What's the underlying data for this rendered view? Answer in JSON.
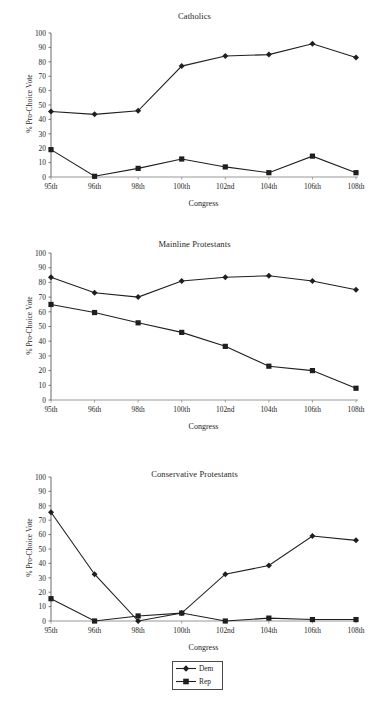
{
  "figure": {
    "legend": {
      "position": "bottom-center",
      "entries": [
        {
          "label": "Dem",
          "marker": "diamond",
          "color": "#1a1a1a"
        },
        {
          "label": "Rep",
          "marker": "square",
          "color": "#1a1a1a"
        }
      ]
    }
  },
  "chart_data": [
    {
      "type": "line",
      "title": "Catholics",
      "xlabel": "Congress",
      "ylabel": "% Pro-Choice Vote",
      "categories": [
        "95th",
        "96th",
        "98th",
        "100th",
        "102nd",
        "104th",
        "106th",
        "108th"
      ],
      "ylim": [
        0,
        100
      ],
      "yticks": [
        0,
        10,
        20,
        30,
        40,
        50,
        60,
        70,
        80,
        90,
        100
      ],
      "grid": false,
      "series": [
        {
          "name": "Dem",
          "marker": "diamond",
          "values": [
            45.5,
            43.5,
            46,
            77,
            84,
            85,
            92.5,
            83
          ]
        },
        {
          "name": "Rep",
          "marker": "square",
          "values": [
            19,
            0.5,
            6,
            12.5,
            7,
            3,
            14.5,
            3
          ]
        }
      ]
    },
    {
      "type": "line",
      "title": "Mainline Protestants",
      "xlabel": "Congress",
      "ylabel": "% Pro-Choice Vote",
      "categories": [
        "95th",
        "96th",
        "98th",
        "100th",
        "102nd",
        "104th",
        "106th",
        "108th"
      ],
      "ylim": [
        0,
        100
      ],
      "yticks": [
        0,
        10,
        20,
        30,
        40,
        50,
        60,
        70,
        80,
        90,
        100
      ],
      "grid": false,
      "series": [
        {
          "name": "Dem",
          "marker": "diamond",
          "values": [
            83.5,
            73,
            70,
            81,
            83.5,
            84.5,
            81,
            75
          ]
        },
        {
          "name": "Rep",
          "marker": "square",
          "values": [
            65,
            59.5,
            52.5,
            46,
            36.5,
            23,
            20,
            8
          ]
        }
      ]
    },
    {
      "type": "line",
      "title": "Conservative Protestants",
      "xlabel": "Congress",
      "ylabel": "% Pro-Choice Vote",
      "categories": [
        "95th",
        "96th",
        "98th",
        "100th",
        "102nd",
        "104th",
        "106th",
        "108th"
      ],
      "ylim": [
        0,
        100
      ],
      "yticks": [
        0,
        10,
        20,
        30,
        40,
        50,
        60,
        70,
        80,
        90,
        100
      ],
      "grid": false,
      "series": [
        {
          "name": "Dem",
          "marker": "diamond",
          "values": [
            75.5,
            32.5,
            0,
            5.5,
            32.5,
            38.5,
            59,
            56
          ]
        },
        {
          "name": "Rep",
          "marker": "square",
          "values": [
            15.5,
            0,
            3.5,
            5.5,
            0,
            2,
            1,
            1
          ]
        }
      ]
    }
  ]
}
